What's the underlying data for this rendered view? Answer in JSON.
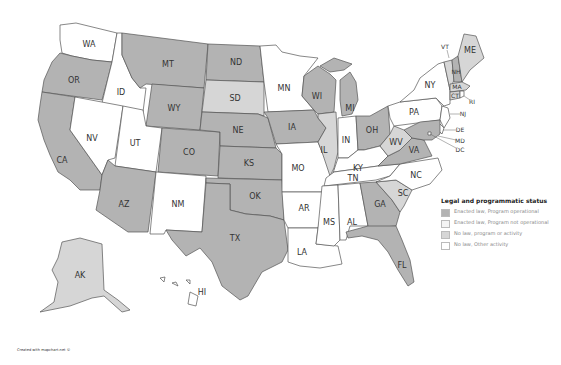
{
  "colors": {
    "enacted_operational": "#b3b3b3",
    "enacted_not_operational": "#f4f4f4",
    "no_law_program": "#d6d6d6",
    "no_law_other": "#ffffff",
    "border": "#555555"
  },
  "legend": {
    "title": "Legal and programmatic status",
    "items": [
      {
        "key": "enacted_operational",
        "label": "Enacted law, Program operational"
      },
      {
        "key": "enacted_not_operational",
        "label": "Enacted law, Program not operational"
      },
      {
        "key": "no_law_program",
        "label": "No law, program or activity"
      },
      {
        "key": "no_law_other",
        "label": "No law, Other activity"
      }
    ]
  },
  "states": {
    "WA": "no_law_other",
    "OR": "enacted_operational",
    "CA": "enacted_operational",
    "ID": "no_law_other",
    "NV": "no_law_other",
    "MT": "enacted_operational",
    "WY": "enacted_operational",
    "UT": "no_law_other",
    "AZ": "enacted_operational",
    "CO": "enacted_operational",
    "NM": "no_law_other",
    "ND": "enacted_operational",
    "SD": "no_law_program",
    "NE": "enacted_operational",
    "KS": "enacted_operational",
    "OK": "enacted_operational",
    "TX": "enacted_operational",
    "MN": "no_law_other",
    "IA": "enacted_operational",
    "MO": "no_law_other",
    "AR": "no_law_other",
    "LA": "no_law_other",
    "WI": "enacted_operational",
    "IL": "no_law_program",
    "MI": "enacted_operational",
    "IN": "no_law_other",
    "OH": "enacted_operational",
    "KY": "no_law_other",
    "TN": "no_law_other",
    "MS": "no_law_other",
    "AL": "no_law_other",
    "GA": "enacted_operational",
    "FL": "enacted_operational",
    "SC": "no_law_program",
    "NC": "no_law_other",
    "VA": "enacted_operational",
    "WV": "no_law_program",
    "PA": "no_law_other",
    "NY": "no_law_other",
    "NJ": "no_law_other",
    "DE": "no_law_other",
    "MD": "enacted_operational",
    "DC": "no_law_other",
    "VT": "no_law_program",
    "NH": "enacted_operational",
    "ME": "no_law_program",
    "MA": "no_law_program",
    "CT": "no_law_program",
    "RI": "no_law_other",
    "AK": "no_law_program",
    "HI": "no_law_other"
  },
  "labels": {
    "WA": "WA",
    "OR": "OR",
    "CA": "CA",
    "ID": "ID",
    "NV": "NV",
    "MT": "MT",
    "WY": "WY",
    "UT": "UT",
    "AZ": "AZ",
    "CO": "CO",
    "NM": "NM",
    "ND": "ND",
    "SD": "SD",
    "NE": "NE",
    "KS": "KS",
    "OK": "OK",
    "TX": "TX",
    "MN": "MN",
    "IA": "IA",
    "MO": "MO",
    "AR": "AR",
    "LA": "LA",
    "WI": "WI",
    "IL": "IL",
    "MI": "MI",
    "IN": "IN",
    "OH": "OH",
    "KY": "KY",
    "TN": "TN",
    "MS": "MS",
    "AL": "AL",
    "GA": "GA",
    "FL": "FL",
    "SC": "SC",
    "NC": "NC",
    "VA": "VA",
    "WV": "WV",
    "PA": "PA",
    "NY": "NY",
    "NJ": "NJ",
    "DE": "DE",
    "MD": "MD",
    "DC": "DC",
    "VT": "VT",
    "NH": "NH",
    "ME": "ME",
    "MA": "MA",
    "CT": "CT",
    "RI": "RI",
    "AK": "AK",
    "HI": "HI"
  },
  "credit": "Created with mapchart.net ©"
}
